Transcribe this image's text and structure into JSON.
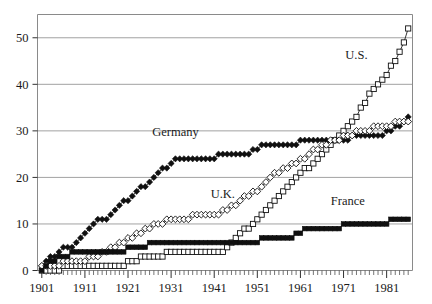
{
  "chart_data": {
    "type": "line",
    "title": "",
    "subtitle": "",
    "xlabel": "",
    "ylabel": "",
    "xlim": [
      1900,
      1987
    ],
    "ylim": [
      0,
      55
    ],
    "yticks": [
      0,
      10,
      20,
      30,
      40,
      50
    ],
    "xticks": [
      1901,
      1911,
      1921,
      1931,
      1941,
      1951,
      1961,
      1971,
      1981
    ],
    "xtick_labels": [
      "1901",
      "1911",
      "1921",
      "1931",
      "1941",
      "1951",
      "1961",
      "1971",
      "1981"
    ],
    "ytick_labels": [
      "0",
      "10",
      "20",
      "30",
      "40",
      "50"
    ],
    "grid": true,
    "grid_axis": "y",
    "legend": "inline-annotations",
    "tick_interval_minor": 1,
    "tick_interval_major": 10,
    "annotations": [
      {
        "text": "U.S.",
        "x": 1974,
        "y": 45.5
      },
      {
        "text": "Germany",
        "x": 1932,
        "y": 29.0
      },
      {
        "text": "U.K.",
        "x": 1943,
        "y": 15.5
      },
      {
        "text": "France",
        "x": 1972,
        "y": 14.0
      }
    ],
    "series": [
      {
        "name": "U.S.",
        "marker": "open-square",
        "x": [
          1901,
          1902,
          1903,
          1904,
          1905,
          1906,
          1907,
          1908,
          1909,
          1910,
          1911,
          1912,
          1913,
          1914,
          1915,
          1916,
          1917,
          1918,
          1919,
          1920,
          1921,
          1922,
          1923,
          1924,
          1925,
          1926,
          1927,
          1928,
          1929,
          1930,
          1931,
          1932,
          1933,
          1934,
          1935,
          1936,
          1937,
          1938,
          1939,
          1940,
          1941,
          1942,
          1943,
          1944,
          1945,
          1946,
          1947,
          1948,
          1949,
          1950,
          1951,
          1952,
          1953,
          1954,
          1955,
          1956,
          1957,
          1958,
          1959,
          1960,
          1961,
          1962,
          1963,
          1964,
          1965,
          1966,
          1967,
          1968,
          1969,
          1970,
          1971,
          1972,
          1973,
          1974,
          1975,
          1976,
          1977,
          1978,
          1979,
          1980,
          1981,
          1982,
          1983,
          1984,
          1985,
          1986
        ],
        "y": [
          0,
          0,
          0,
          0,
          0,
          1,
          1,
          1,
          1,
          1,
          1,
          1,
          1,
          1,
          1,
          1,
          1,
          1,
          1,
          1,
          2,
          2,
          2,
          3,
          3,
          3,
          3,
          3,
          3,
          4,
          4,
          4,
          4,
          4,
          4,
          4,
          4,
          4,
          4,
          4,
          4,
          4,
          4,
          5,
          6,
          7,
          8,
          9,
          9,
          10,
          11,
          12,
          13,
          14,
          15,
          16,
          17,
          18,
          19,
          20,
          21,
          22,
          22,
          23,
          24,
          25,
          26,
          27,
          28,
          29,
          30,
          31,
          32,
          33,
          35,
          36,
          38,
          39,
          40,
          41,
          42,
          44,
          45,
          47,
          49,
          52
        ]
      },
      {
        "name": "Germany",
        "marker": "filled-diamond",
        "x": [
          1901,
          1902,
          1903,
          1904,
          1905,
          1906,
          1907,
          1908,
          1909,
          1910,
          1911,
          1912,
          1913,
          1914,
          1915,
          1916,
          1917,
          1918,
          1919,
          1920,
          1921,
          1922,
          1923,
          1924,
          1925,
          1926,
          1927,
          1928,
          1929,
          1930,
          1931,
          1932,
          1933,
          1934,
          1935,
          1936,
          1937,
          1938,
          1939,
          1940,
          1941,
          1942,
          1943,
          1944,
          1945,
          1946,
          1947,
          1948,
          1949,
          1950,
          1951,
          1952,
          1953,
          1954,
          1955,
          1956,
          1957,
          1958,
          1959,
          1960,
          1961,
          1962,
          1963,
          1964,
          1965,
          1966,
          1967,
          1968,
          1969,
          1970,
          1971,
          1972,
          1973,
          1974,
          1975,
          1976,
          1977,
          1978,
          1979,
          1980,
          1981,
          1982,
          1983,
          1984,
          1985,
          1986
        ],
        "y": [
          1,
          2,
          3,
          3,
          4,
          5,
          5,
          5,
          6,
          7,
          8,
          9,
          10,
          11,
          11,
          11,
          12,
          13,
          14,
          15,
          15,
          16,
          17,
          18,
          18,
          19,
          20,
          21,
          22,
          22,
          23,
          24,
          24,
          24,
          24,
          24,
          24,
          24,
          24,
          24,
          24,
          25,
          25,
          25,
          25,
          25,
          25,
          25,
          25,
          26,
          26,
          27,
          27,
          27,
          27,
          27,
          27,
          27,
          27,
          27,
          28,
          28,
          28,
          28,
          28,
          28,
          28,
          28,
          28,
          28,
          28,
          28,
          29,
          29,
          29,
          29,
          29,
          29,
          29,
          29,
          30,
          30,
          31,
          31,
          32,
          33
        ]
      },
      {
        "name": "U.K.",
        "marker": "open-diamond",
        "x": [
          1901,
          1902,
          1903,
          1904,
          1905,
          1906,
          1907,
          1908,
          1909,
          1910,
          1911,
          1912,
          1913,
          1914,
          1915,
          1916,
          1917,
          1918,
          1919,
          1920,
          1921,
          1922,
          1923,
          1924,
          1925,
          1926,
          1927,
          1928,
          1929,
          1930,
          1931,
          1932,
          1933,
          1934,
          1935,
          1936,
          1937,
          1938,
          1939,
          1940,
          1941,
          1942,
          1943,
          1944,
          1945,
          1946,
          1947,
          1948,
          1949,
          1950,
          1951,
          1952,
          1953,
          1954,
          1955,
          1956,
          1957,
          1958,
          1959,
          1960,
          1961,
          1962,
          1963,
          1964,
          1965,
          1966,
          1967,
          1968,
          1969,
          1970,
          1971,
          1972,
          1973,
          1974,
          1975,
          1976,
          1977,
          1978,
          1979,
          1980,
          1981,
          1982,
          1983,
          1984,
          1985,
          1986
        ],
        "y": [
          1,
          1,
          1,
          1,
          1,
          2,
          2,
          2,
          2,
          2,
          2,
          3,
          3,
          3,
          4,
          4,
          5,
          5,
          6,
          6,
          7,
          7,
          8,
          8,
          9,
          9,
          10,
          10,
          10,
          11,
          11,
          11,
          11,
          11,
          11,
          12,
          12,
          12,
          12,
          12,
          12,
          12,
          13,
          13,
          14,
          14,
          15,
          16,
          16,
          17,
          17,
          18,
          19,
          20,
          21,
          21,
          22,
          22,
          23,
          23,
          24,
          24,
          25,
          26,
          26,
          27,
          27,
          28,
          28,
          28,
          29,
          29,
          29,
          30,
          30,
          30,
          30,
          31,
          31,
          31,
          31,
          31,
          32,
          32,
          32,
          32
        ]
      },
      {
        "name": "France",
        "marker": "filled-square",
        "x": [
          1901,
          1902,
          1903,
          1904,
          1905,
          1906,
          1907,
          1908,
          1909,
          1910,
          1911,
          1912,
          1913,
          1914,
          1915,
          1916,
          1917,
          1918,
          1919,
          1920,
          1921,
          1922,
          1923,
          1924,
          1925,
          1926,
          1927,
          1928,
          1929,
          1930,
          1931,
          1932,
          1933,
          1934,
          1935,
          1936,
          1937,
          1938,
          1939,
          1940,
          1941,
          1942,
          1943,
          1944,
          1945,
          1946,
          1947,
          1948,
          1949,
          1950,
          1951,
          1952,
          1953,
          1954,
          1955,
          1956,
          1957,
          1958,
          1959,
          1960,
          1961,
          1962,
          1963,
          1964,
          1965,
          1966,
          1967,
          1968,
          1969,
          1970,
          1971,
          1972,
          1973,
          1974,
          1975,
          1976,
          1977,
          1978,
          1979,
          1980,
          1981,
          1982,
          1983,
          1984,
          1985,
          1986
        ],
        "y": [
          0,
          1,
          2,
          2,
          3,
          3,
          3,
          4,
          4,
          4,
          4,
          4,
          4,
          4,
          4,
          4,
          4,
          4,
          4,
          4,
          5,
          5,
          5,
          5,
          5,
          6,
          6,
          6,
          6,
          6,
          6,
          6,
          6,
          6,
          6,
          6,
          6,
          6,
          6,
          6,
          6,
          6,
          6,
          6,
          6,
          6,
          6,
          6,
          6,
          6,
          6,
          7,
          7,
          7,
          7,
          7,
          7,
          7,
          7,
          8,
          8,
          9,
          9,
          9,
          9,
          9,
          9,
          9,
          9,
          9,
          10,
          10,
          10,
          10,
          10,
          10,
          10,
          10,
          10,
          10,
          10,
          11,
          11,
          11,
          11,
          11
        ]
      }
    ]
  }
}
